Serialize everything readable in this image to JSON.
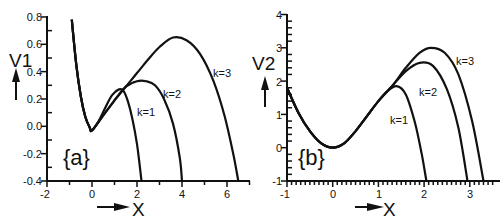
{
  "chart_data": [
    {
      "type": "line",
      "panel": "a",
      "panel_label": "{a}",
      "xlabel": "X",
      "ylabel": "V1",
      "xlim": [
        -2,
        7
      ],
      "ylim": [
        -0.4,
        0.8
      ],
      "xticks": [
        "-2",
        "0",
        "2",
        "4",
        "6"
      ],
      "yticks": [
        "0.8",
        "0.6",
        "0.4",
        "0.2",
        "0.0",
        "-0.2",
        "-0.4"
      ],
      "grid": false,
      "series": [
        {
          "name": "k=1",
          "x": [
            -0.9,
            -0.7,
            -0.5,
            -0.3,
            -0.1,
            0.0,
            0.3,
            0.6,
            0.9,
            1.2,
            1.4,
            1.6,
            1.8,
            2.0,
            2.1,
            2.2
          ],
          "y": [
            0.78,
            0.45,
            0.22,
            0.07,
            -0.01,
            -0.03,
            0.04,
            0.14,
            0.23,
            0.27,
            0.26,
            0.18,
            0.05,
            -0.13,
            -0.26,
            -0.4
          ]
        },
        {
          "name": "k=2",
          "x": [
            -0.9,
            -0.7,
            -0.5,
            -0.3,
            -0.1,
            0.0,
            0.5,
            1.0,
            1.5,
            2.0,
            2.4,
            2.8,
            3.2,
            3.6,
            3.9,
            4.0
          ],
          "y": [
            0.78,
            0.45,
            0.22,
            0.07,
            -0.01,
            -0.03,
            0.08,
            0.19,
            0.29,
            0.33,
            0.33,
            0.3,
            0.2,
            0.02,
            -0.23,
            -0.4
          ]
        },
        {
          "name": "k=3",
          "x": [
            -0.9,
            -0.7,
            -0.5,
            -0.3,
            -0.1,
            0.0,
            0.5,
            1.0,
            1.5,
            2.0,
            2.5,
            3.0,
            3.6,
            4.2,
            4.8,
            5.4,
            5.9,
            6.3,
            6.5
          ],
          "y": [
            0.78,
            0.45,
            0.22,
            0.07,
            -0.01,
            -0.03,
            0.08,
            0.19,
            0.29,
            0.39,
            0.49,
            0.58,
            0.65,
            0.63,
            0.53,
            0.33,
            0.07,
            -0.22,
            -0.4
          ]
        }
      ],
      "annotations": [
        "k=1",
        "k=2",
        "k=3"
      ]
    },
    {
      "type": "line",
      "panel": "b",
      "panel_label": "{b}",
      "xlabel": "X",
      "ylabel": "V2",
      "xlim": [
        -1,
        3.5
      ],
      "ylim": [
        -1,
        4
      ],
      "xticks": [
        "-1",
        "0",
        "1",
        "2",
        "3"
      ],
      "yticks": [
        "4",
        "3",
        "2",
        "1",
        "0",
        "-1"
      ],
      "grid": false,
      "series": [
        {
          "name": "k=1",
          "x": [
            -1.0,
            -0.75,
            -0.5,
            -0.25,
            0.0,
            0.25,
            0.5,
            0.75,
            1.0,
            1.2,
            1.4,
            1.6,
            1.8,
            1.95,
            2.05
          ],
          "y": [
            1.8,
            1.05,
            0.5,
            0.13,
            0.0,
            0.13,
            0.5,
            0.95,
            1.4,
            1.7,
            1.85,
            1.6,
            0.75,
            -0.2,
            -1.0
          ]
        },
        {
          "name": "k=2",
          "x": [
            -1.0,
            -0.75,
            -0.5,
            -0.25,
            0.0,
            0.25,
            0.5,
            0.75,
            1.0,
            1.3,
            1.6,
            1.9,
            2.2,
            2.5,
            2.75,
            2.95
          ],
          "y": [
            1.8,
            1.05,
            0.5,
            0.13,
            0.0,
            0.13,
            0.5,
            0.95,
            1.4,
            1.85,
            2.3,
            2.55,
            2.45,
            1.75,
            0.6,
            -1.0
          ]
        },
        {
          "name": "k=3",
          "x": [
            -1.0,
            -0.75,
            -0.5,
            -0.25,
            0.0,
            0.25,
            0.5,
            0.75,
            1.0,
            1.3,
            1.6,
            1.9,
            2.15,
            2.45,
            2.75,
            3.05,
            3.3
          ],
          "y": [
            1.8,
            1.05,
            0.5,
            0.13,
            0.0,
            0.13,
            0.5,
            0.95,
            1.4,
            1.85,
            2.4,
            2.85,
            3.0,
            2.85,
            2.2,
            0.8,
            -1.0
          ]
        }
      ],
      "annotations": [
        "k=1",
        "k=2",
        "k=3"
      ]
    }
  ],
  "panels": {
    "a": {
      "label": "{a}",
      "ylabel": "V1",
      "xlabel": "X",
      "xticks": [
        "-2",
        "0",
        "2",
        "4",
        "6"
      ],
      "yticks": [
        "0.8",
        "0.6",
        "0.4",
        "0.2",
        "0.0",
        "-0.2",
        "-0.4"
      ],
      "curve_labels": [
        "k=1",
        "k=2",
        "k=3"
      ]
    },
    "b": {
      "label": "{b}",
      "ylabel": "V2",
      "xlabel": "X",
      "xticks": [
        "-1",
        "0",
        "1",
        "2",
        "3"
      ],
      "yticks": [
        "4",
        "3",
        "2",
        "1",
        "0",
        "-1"
      ],
      "curve_labels": [
        "k=1",
        "k=2",
        "k=3"
      ]
    }
  },
  "colors": {
    "line": "#111111",
    "background": "#ffffff"
  }
}
